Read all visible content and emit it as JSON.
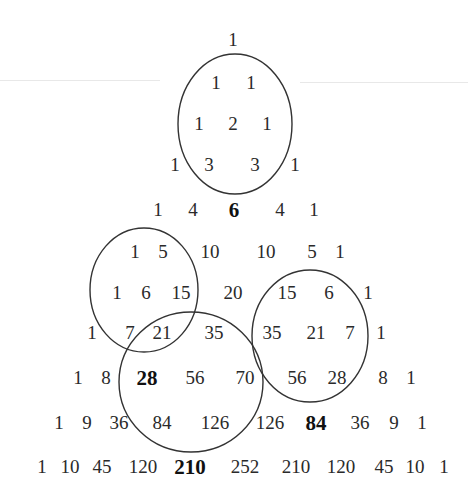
{
  "rows": [
    {
      "y": 40,
      "cells": [
        {
          "v": "1",
          "x": 233
        }
      ]
    },
    {
      "y": 83,
      "cells": [
        {
          "v": "1",
          "x": 216
        },
        {
          "v": "1",
          "x": 251
        }
      ]
    },
    {
      "y": 124,
      "cells": [
        {
          "v": "1",
          "x": 199
        },
        {
          "v": "2",
          "x": 233
        },
        {
          "v": "1",
          "x": 267
        }
      ]
    },
    {
      "y": 165,
      "cells": [
        {
          "v": "1",
          "x": 175
        },
        {
          "v": "3",
          "x": 209
        },
        {
          "v": "3",
          "x": 255
        },
        {
          "v": "1",
          "x": 295
        }
      ]
    },
    {
      "y": 210,
      "cells": [
        {
          "v": "1",
          "x": 158
        },
        {
          "v": "4",
          "x": 193
        },
        {
          "v": "6",
          "x": 234,
          "bold": true
        },
        {
          "v": "4",
          "x": 280
        },
        {
          "v": "1",
          "x": 314
        }
      ]
    },
    {
      "y": 252,
      "cells": [
        {
          "v": "1",
          "x": 135
        },
        {
          "v": "5",
          "x": 163
        },
        {
          "v": "10",
          "x": 210
        },
        {
          "v": "10",
          "x": 266
        },
        {
          "v": "5",
          "x": 312
        },
        {
          "v": "1",
          "x": 340
        }
      ]
    },
    {
      "y": 293,
      "cells": [
        {
          "v": "1",
          "x": 117
        },
        {
          "v": "6",
          "x": 146
        },
        {
          "v": "15",
          "x": 181
        },
        {
          "v": "20",
          "x": 233
        },
        {
          "v": "15",
          "x": 287
        },
        {
          "v": "6",
          "x": 329
        },
        {
          "v": "1",
          "x": 368
        }
      ]
    },
    {
      "y": 333,
      "cells": [
        {
          "v": "1",
          "x": 92
        },
        {
          "v": "7",
          "x": 130
        },
        {
          "v": "21",
          "x": 162
        },
        {
          "v": "35",
          "x": 214
        },
        {
          "v": "35",
          "x": 272
        },
        {
          "v": "21",
          "x": 316
        },
        {
          "v": "7",
          "x": 350
        },
        {
          "v": "1",
          "x": 381
        }
      ]
    },
    {
      "y": 378,
      "cells": [
        {
          "v": "1",
          "x": 78
        },
        {
          "v": "8",
          "x": 106
        },
        {
          "v": "28",
          "x": 147,
          "bold": true
        },
        {
          "v": "56",
          "x": 195
        },
        {
          "v": "70",
          "x": 245
        },
        {
          "v": "56",
          "x": 297
        },
        {
          "v": "28",
          "x": 337
        },
        {
          "v": "8",
          "x": 383
        },
        {
          "v": "1",
          "x": 411
        }
      ]
    },
    {
      "y": 423,
      "cells": [
        {
          "v": "1",
          "x": 59
        },
        {
          "v": "9",
          "x": 87
        },
        {
          "v": "36",
          "x": 119
        },
        {
          "v": "84",
          "x": 162
        },
        {
          "v": "126",
          "x": 215
        },
        {
          "v": "126",
          "x": 270
        },
        {
          "v": "84",
          "x": 316,
          "bold": true
        },
        {
          "v": "36",
          "x": 360
        },
        {
          "v": "9",
          "x": 394
        },
        {
          "v": "1",
          "x": 422
        }
      ]
    },
    {
      "y": 467,
      "cells": [
        {
          "v": "1",
          "x": 42
        },
        {
          "v": "10",
          "x": 70
        },
        {
          "v": "45",
          "x": 102
        },
        {
          "v": "120",
          "x": 143
        },
        {
          "v": "210",
          "x": 190,
          "bold": true
        },
        {
          "v": "252",
          "x": 245
        },
        {
          "v": "210",
          "x": 296
        },
        {
          "v": "120",
          "x": 341
        },
        {
          "v": "45",
          "x": 384
        },
        {
          "v": "10",
          "x": 415
        },
        {
          "v": "1",
          "x": 444
        }
      ]
    }
  ],
  "ellipses": [
    {
      "name": "ellipse-top",
      "cx": 235,
      "cy": 124,
      "rx": 57,
      "ry": 70,
      "encloses": [
        "1",
        "1",
        "1",
        "2",
        "1",
        "3",
        "3"
      ],
      "sum": "6"
    },
    {
      "name": "ellipse-left",
      "cx": 144,
      "cy": 290,
      "rx": 54,
      "ry": 62,
      "encloses": [
        "1",
        "5",
        "1",
        "6",
        "15",
        "7",
        "21"
      ],
      "sum": "28"
    },
    {
      "name": "ellipse-right",
      "cx": 310,
      "cy": 336,
      "rx": 58,
      "ry": 66,
      "encloses": [
        "15",
        "6",
        "35",
        "21",
        "7",
        "56",
        "28"
      ],
      "sum": "84"
    },
    {
      "name": "ellipse-bottom",
      "cx": 191,
      "cy": 382,
      "rx": 72,
      "ry": 70,
      "encloses": [
        "21",
        "35",
        "28",
        "56",
        "70",
        "84",
        "126"
      ],
      "sum": "210"
    }
  ],
  "colors": {
    "text": "#2a2a2a",
    "bold_text": "#111111",
    "stroke": "#333333",
    "background": "#ffffff"
  }
}
